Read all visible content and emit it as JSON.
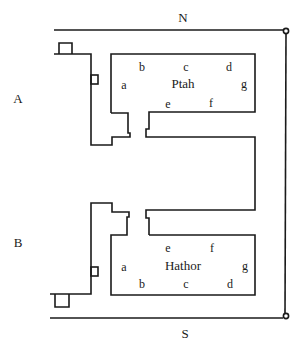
{
  "diagram": {
    "compass": {
      "north": "N",
      "south": "S"
    },
    "sections": [
      {
        "id": "A",
        "label": "A"
      },
      {
        "id": "B",
        "label": "B"
      }
    ],
    "chapels": [
      {
        "name": "Ptah",
        "position_labels": {
          "a": "a",
          "b": "b",
          "c": "c",
          "d": "d",
          "e": "e",
          "f": "f",
          "g": "g"
        }
      },
      {
        "name": "Hathor",
        "position_labels": {
          "a": "a",
          "b": "b",
          "c": "c",
          "d": "d",
          "e": "e",
          "f": "f",
          "g": "g"
        }
      }
    ]
  }
}
